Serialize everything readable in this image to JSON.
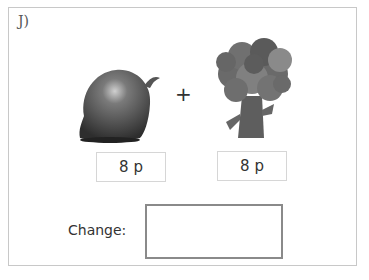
{
  "question": {
    "label": "J)",
    "operator": "+",
    "items": [
      {
        "name": "onion",
        "icon": "onion-icon",
        "price": "8 p"
      },
      {
        "name": "broccoli",
        "icon": "broccoli-icon",
        "price": "8 p"
      }
    ],
    "change_label": "Change:",
    "change_value": ""
  },
  "colors": {
    "frame_border": "#c8c8c8",
    "price_border": "#d6d6d6",
    "answer_border": "#8a8a8a"
  }
}
